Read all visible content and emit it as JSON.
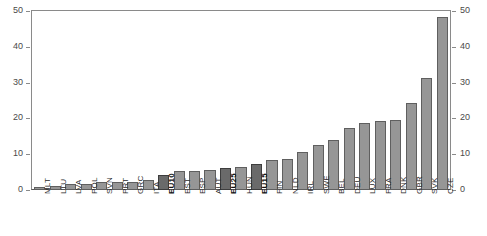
{
  "chart_data": {
    "type": "bar",
    "title": "",
    "xlabel": "",
    "ylabel": "",
    "ylim": [
      0,
      50
    ],
    "yticks": [
      0,
      10,
      20,
      30,
      40,
      50
    ],
    "grid": false,
    "legend": null,
    "axis_left_ticks": [
      "0",
      "10",
      "20",
      "30",
      "40",
      "50"
    ],
    "axis_right_ticks": [
      "0",
      "10",
      "20",
      "30",
      "40",
      "50"
    ],
    "categories": [
      "MLT",
      "LTU",
      "LVA",
      "POL",
      "SVN",
      "PRT",
      "GRC",
      "ITA",
      "EU10",
      "EST",
      "ESP",
      "AUT",
      "EU25",
      "HUN",
      "EU15",
      "FIN",
      "NLD",
      "IRL",
      "SWE",
      "BEL",
      "DEU",
      "LUX",
      "FRA",
      "DNK",
      "GBR",
      "SVK",
      "CZE"
    ],
    "values": [
      0.8,
      1.2,
      1.7,
      1.7,
      2.1,
      2.2,
      2.2,
      2.7,
      4.3,
      5.2,
      5.2,
      5.6,
      6.1,
      6.4,
      7.2,
      8.3,
      8.7,
      10.5,
      12.6,
      14.0,
      17.3,
      18.8,
      19.2,
      19.5,
      24.4,
      31.2,
      48.2
    ],
    "highlighted": [
      "EU10",
      "EU25",
      "EU15"
    ],
    "colors": {
      "bar": "#969696",
      "bar_border": "#5f5f5f",
      "bar_highlight": "#6a6a6a",
      "bar_highlight_border": "#3d3d3d",
      "axis": "#8a8a8a",
      "text": "#2b2b2b",
      "background": "#ffffff"
    }
  },
  "title_remnant": "· ·"
}
